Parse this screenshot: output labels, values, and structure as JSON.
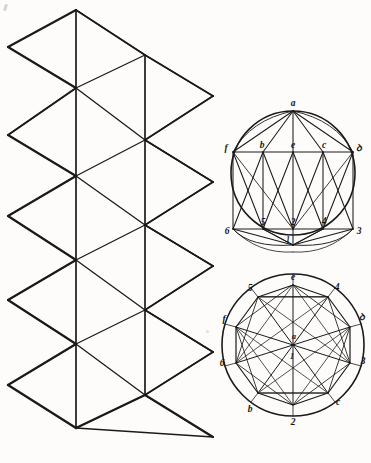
{
  "plate": {
    "title": "Geometric plate: triangular net and two inscribed polygon circles",
    "background_color": "#fdfcfa",
    "ink_color": "#1a1a1a"
  },
  "figures": [
    {
      "name": "triangular-net",
      "description": "Zig-zag strip of rhombi divided into triangles by vertical and diagonal lines",
      "vertex_labels": []
    },
    {
      "name": "upper-circle",
      "description": "Circle with inscribed antiprism net: apex a, upper band f b e c d, lower band 6 5 2 4 3, nadir 1",
      "apex_label": "a",
      "nadir_label": "1",
      "upper_band": [
        "f",
        "b",
        "e",
        "c",
        "d"
      ],
      "lower_band": [
        "6",
        "5",
        "2",
        "4",
        "3"
      ]
    },
    {
      "name": "lower-circle",
      "description": "Circle with inscribed decagon, all vertices joined to centre a / 1",
      "centre_labels": [
        "a",
        "1"
      ],
      "rim_labels": [
        "e",
        "5",
        "4",
        "f",
        "d",
        "6",
        "3",
        "b",
        "2",
        "c"
      ]
    }
  ],
  "upper_circle_labels": {
    "a": "a",
    "f": "f",
    "b": "b",
    "e": "e",
    "c": "c",
    "d": "ꝺ",
    "six": "6",
    "five": "5",
    "two": "2",
    "four": "4",
    "three": "3",
    "one": "1"
  },
  "lower_circle_labels": {
    "e_top": "e",
    "five": "5",
    "four": "4",
    "f": "f",
    "d": "ꝺ",
    "six": "6",
    "three": "3",
    "b": "b",
    "two": "2",
    "c": "c",
    "centre_a": "a",
    "centre_one": "1"
  }
}
